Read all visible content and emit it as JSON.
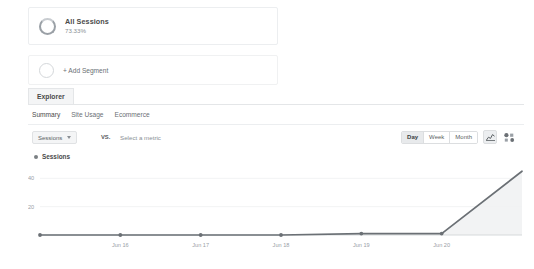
{
  "segment": {
    "name": "All Sessions",
    "percent": "73.33%",
    "icon": "donut-icon"
  },
  "add_segment": {
    "label": "+ Add Segment",
    "icon": "empty-circle-icon"
  },
  "panel": {
    "tab": "Explorer",
    "subtabs": [
      {
        "label": "Summary",
        "active": true
      },
      {
        "label": "Site Usage",
        "active": false
      },
      {
        "label": "Ecommerce",
        "active": false
      }
    ]
  },
  "controls": {
    "primary_metric": "Sessions",
    "vs_label": "VS.",
    "secondary_metric_placeholder": "Select a metric",
    "granularity": [
      {
        "label": "Day",
        "active": true
      },
      {
        "label": "Week",
        "active": false
      },
      {
        "label": "Month",
        "active": false
      }
    ],
    "view_icons": [
      {
        "name": "line-chart-icon",
        "active": true
      },
      {
        "name": "motion-chart-icon",
        "active": false
      }
    ]
  },
  "legend": {
    "series_label": "Sessions",
    "dot_color": "#7b8084"
  },
  "chart_data": {
    "type": "line",
    "title": "",
    "xlabel": "",
    "ylabel": "Sessions",
    "categories": [
      "Jun 15",
      "Jun 16",
      "Jun 17",
      "Jun 18",
      "Jun 19",
      "Jun 20",
      "Jun 21"
    ],
    "x_tick_labels": [
      "Jun 16",
      "Jun 17",
      "Jun 18",
      "Jun 19",
      "Jun 20"
    ],
    "y_tick_labels": [
      "20",
      "40"
    ],
    "y_ticks": [
      20,
      40
    ],
    "ylim": [
      0,
      48
    ],
    "grid": true,
    "legend_position": "top-left",
    "series": [
      {
        "name": "Sessions",
        "color": "#6b7075",
        "fill": "#f0f1f2",
        "values": [
          0,
          0,
          0,
          0,
          1,
          1,
          45
        ]
      }
    ]
  }
}
